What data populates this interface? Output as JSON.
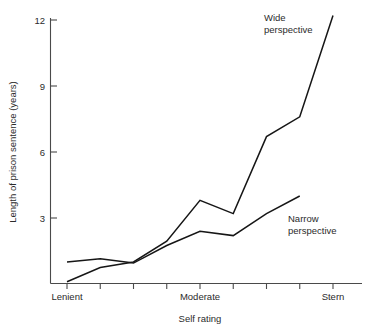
{
  "chart_data": {
    "type": "line",
    "title": "",
    "xlabel": "Self rating",
    "ylabel": "Length of prison sentence (years)",
    "x": [
      1,
      2,
      3,
      4,
      5,
      6,
      7,
      8,
      9
    ],
    "xtick_labels": [
      "Lenient",
      "",
      "",
      "",
      "Moderate",
      "",
      "",
      "",
      "Stern"
    ],
    "ytick_values": [
      3,
      6,
      9,
      12
    ],
    "ytick_labels": [
      "3",
      "6",
      "9",
      "12"
    ],
    "ylim": [
      0,
      12.8
    ],
    "xlim": [
      0.45,
      9.5
    ],
    "grid": false,
    "legend_position": "inline-annotations",
    "series": [
      {
        "name": "Wide perspective",
        "label": "Wide",
        "label_line2": "perspective",
        "x": [
          1,
          2,
          3,
          4,
          5,
          6,
          7,
          8,
          9
        ],
        "values": [
          0.1,
          0.75,
          1.0,
          1.95,
          3.8,
          3.2,
          6.7,
          7.6,
          12.2
        ]
      },
      {
        "name": "Narrow perspective",
        "label": "Narrow",
        "label_line2": "perspective",
        "x": [
          1,
          2,
          3,
          4,
          5,
          6,
          7,
          8
        ],
        "values": [
          1.0,
          1.15,
          0.95,
          1.75,
          2.4,
          2.2,
          3.2,
          4.0
        ]
      }
    ],
    "annotations": [
      {
        "text": "Wide",
        "text2": "perspective"
      },
      {
        "text": "Narrow",
        "text2": "perspective"
      }
    ],
    "colors": {
      "line": "#161616",
      "axis": "#4a4a4a",
      "text": "#2b2b2b",
      "background": "#ffffff"
    }
  },
  "labels": {
    "ytick_12": "12",
    "ytick_9": "9",
    "ytick_6": "6",
    "ytick_3": "3",
    "x_lenient": "Lenient",
    "x_moderate": "Moderate",
    "x_stern": "Stern",
    "y_axis_title": "Length of prison sentence (years)",
    "x_axis_title": "Self rating",
    "annot_wide_1": "Wide",
    "annot_wide_2": "perspective",
    "annot_narrow_1": "Narrow",
    "annot_narrow_2": "perspective"
  }
}
